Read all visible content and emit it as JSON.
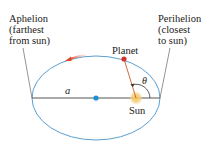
{
  "labels": {
    "aphelion": "Aphelion\n(farthest\nfrom sun)",
    "perihelion": "Perihelion\n(closest\nto sun)",
    "planet": "Planet",
    "sun": "Sun",
    "semi_major_axis": "a",
    "angle": "θ"
  },
  "colors": {
    "orbit": "#5b9fd1",
    "axis_line": "#555555",
    "planet": "#d93030",
    "radius_line": "#d2693c",
    "sun": "#f0c060",
    "center_dot": "#1f8fd6",
    "leader_line": "#666666",
    "arrow": "#e0452a"
  }
}
